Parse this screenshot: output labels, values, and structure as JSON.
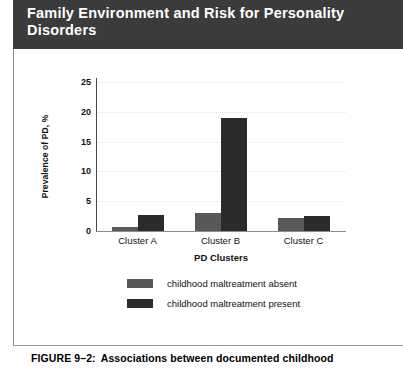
{
  "header": {
    "title": "Family Environment and Risk for Personality Disorders"
  },
  "caption": {
    "number": "FIGURE 9–2:",
    "text": "Associations between documented childhood"
  },
  "chart_data": {
    "type": "bar",
    "title": "",
    "categories": [
      "Cluster A",
      "Cluster B",
      "Cluster C"
    ],
    "series": [
      {
        "name": "childhood maltreatment absent",
        "color": "#595959",
        "values": [
          0.7,
          3.0,
          2.1
        ]
      },
      {
        "name": "childhood maltreatment present",
        "color": "#2b2b2b",
        "values": [
          2.7,
          19.0,
          2.6
        ]
      }
    ],
    "xlabel": "PD Clusters",
    "ylabel": "Prevalence of PD, %",
    "ylim": [
      0,
      25
    ],
    "yticks": [
      0,
      5,
      10,
      15,
      20,
      25
    ],
    "ytick_labels": [
      "0",
      "5",
      "10",
      "15",
      "20",
      "25"
    ],
    "grid": true,
    "grid_axis": "y",
    "legend_position": "bottom-center"
  }
}
